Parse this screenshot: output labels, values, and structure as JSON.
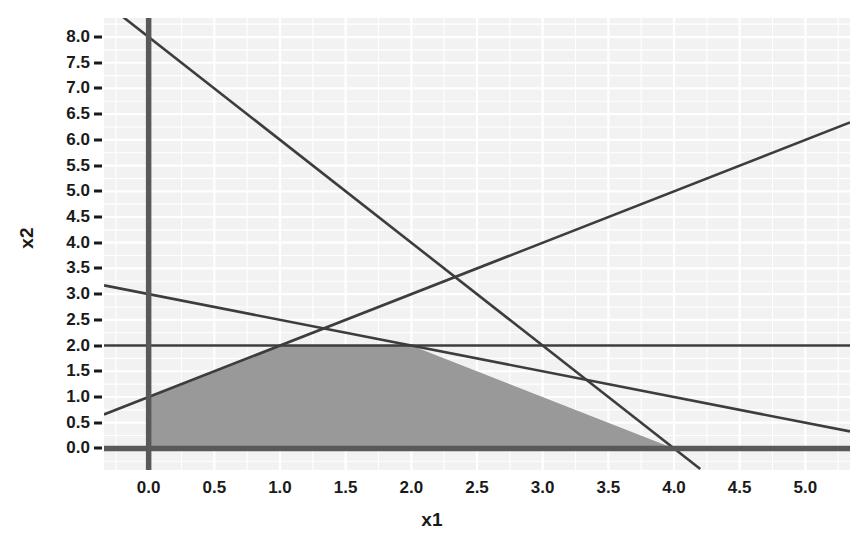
{
  "chart_data": {
    "type": "line",
    "title": "",
    "xlabel": "x1",
    "ylabel": "x2",
    "xlim": [
      -0.34,
      5.34
    ],
    "ylim": [
      -0.42,
      8.37
    ],
    "grid": true,
    "legend": "none",
    "panel_background": "#f2f2f2",
    "grid_color": "#ffffff",
    "line_color": "#3d3d3d",
    "axis_line_color": "#595959",
    "region_fill": "#999999",
    "xticks": [
      0.0,
      0.5,
      1.0,
      1.5,
      2.0,
      2.5,
      3.0,
      3.5,
      4.0,
      4.5,
      5.0
    ],
    "xtick_labels": [
      "0.0",
      "0.5",
      "1.0",
      "1.5",
      "2.0",
      "2.5",
      "3.0",
      "3.5",
      "4.0",
      "4.5",
      "5.0"
    ],
    "yticks": [
      0.0,
      0.5,
      1.0,
      1.5,
      2.0,
      2.5,
      3.0,
      3.5,
      4.0,
      4.5,
      5.0,
      5.5,
      6.0,
      6.5,
      7.0,
      7.5,
      8.0
    ],
    "ytick_labels": [
      "0.0",
      "0.5",
      "1.0",
      "1.5",
      "2.0",
      "2.5",
      "3.0",
      "3.5",
      "4.0",
      "4.5",
      "5.0",
      "5.5",
      "6.0",
      "6.5",
      "7.0",
      "7.5",
      "8.0"
    ],
    "series": [
      {
        "name": "constraint-steep-descending",
        "equation": "2*x1 + x2 = 8",
        "slope": -2.0,
        "intercept": 8.0,
        "x": [
          -0.34,
          4.2
        ],
        "y": [
          8.68,
          -0.4
        ]
      },
      {
        "name": "constraint-rising",
        "equation": "x2 - x1 = 1",
        "slope": 1.0,
        "intercept": 1.0,
        "x": [
          -0.34,
          5.34
        ],
        "y": [
          0.66,
          6.34
        ]
      },
      {
        "name": "constraint-shallow-descending",
        "equation": "x1 + 2*x2 = 6",
        "slope": -0.5,
        "intercept": 3.0,
        "x": [
          -0.34,
          5.34
        ],
        "y": [
          3.17,
          0.33
        ]
      },
      {
        "name": "constraint-horizontal",
        "equation": "x2 = 2",
        "slope": 0.0,
        "intercept": 2.0,
        "x": [
          -0.34,
          5.34
        ],
        "y": [
          2.0,
          2.0
        ]
      },
      {
        "name": "axis-x2-equals-zero",
        "equation": "x2 = 0",
        "slope": 0.0,
        "intercept": 0.0,
        "x": [
          -0.34,
          5.34
        ],
        "y": [
          0.0,
          0.0
        ]
      },
      {
        "name": "axis-x1-equals-zero",
        "equation": "x1 = 0",
        "x": [
          0.0,
          0.0
        ],
        "y": [
          -0.42,
          8.37
        ]
      }
    ],
    "feasible_region": {
      "name": "feasible-region",
      "fill": "#999999",
      "vertices": [
        [
          0.0,
          0.0
        ],
        [
          0.0,
          1.0
        ],
        [
          1.0,
          2.0
        ],
        [
          2.0,
          2.0
        ],
        [
          4.0,
          0.0
        ]
      ]
    }
  }
}
